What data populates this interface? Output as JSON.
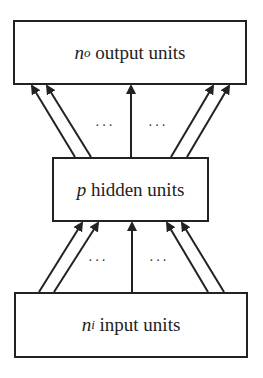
{
  "layers": {
    "output": {
      "var": "n",
      "sub": "o",
      "label": "output units"
    },
    "hidden": {
      "var": "p",
      "sub": "",
      "label": "hidden units"
    },
    "input": {
      "var": "n",
      "sub": "i",
      "label": "input units"
    }
  },
  "ellipsis": "···",
  "colors": {
    "stroke": "#222222",
    "background": "#ffffff"
  }
}
